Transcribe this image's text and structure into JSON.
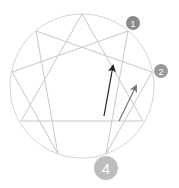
{
  "diagram": {
    "type": "enneagram",
    "circle": {
      "cx": 82,
      "cy": 86,
      "r": 72,
      "stroke": "#d4d4d4"
    },
    "points": {
      "9": [
        82,
        14
      ],
      "1": [
        128,
        31
      ],
      "2": [
        152,
        72
      ],
      "3": [
        143,
        121
      ],
      "4": [
        106,
        154
      ],
      "5": [
        58,
        154
      ],
      "6": [
        21,
        121
      ],
      "7": [
        12,
        72
      ],
      "8": [
        36,
        31
      ]
    },
    "line_color": "#c8c8c8",
    "triangle": [
      "9",
      "3",
      "6"
    ],
    "hexad": [
      "1",
      "4",
      "2",
      "8",
      "5",
      "7"
    ],
    "arrows": [
      {
        "name": "dark-arrow",
        "from": [
          104,
          116
        ],
        "to": [
          113,
          66
        ],
        "color": "#222222"
      },
      {
        "name": "gray-arrow",
        "from": [
          119,
          121
        ],
        "to": [
          136,
          86
        ],
        "color": "#777777"
      }
    ],
    "badges": [
      {
        "label": "1",
        "cx": 133,
        "cy": 23,
        "r": 7,
        "color": "#8a8a8a",
        "font_size": 9
      },
      {
        "label": "2",
        "cx": 161,
        "cy": 71,
        "r": 7,
        "color": "#9a9a9a",
        "font_size": 9
      },
      {
        "label": "4",
        "cx": 106,
        "cy": 168,
        "r": 12,
        "color": "#bdbdbd",
        "font_size": 15
      }
    ]
  }
}
